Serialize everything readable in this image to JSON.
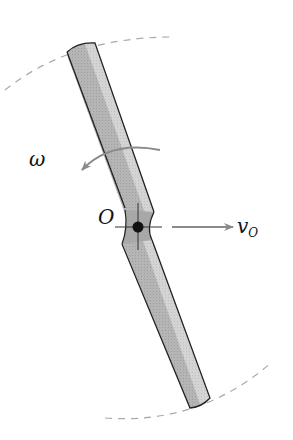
{
  "figure": {
    "labels": {
      "omega": "ω",
      "pivot": "O",
      "velocity_main": "v",
      "velocity_sub": "O"
    },
    "colors": {
      "background": "#ffffff",
      "rod_dark": "#9a9a9a",
      "rod_mid": "#b8b8b8",
      "rod_light": "#d8d8d8",
      "outline": "#222222",
      "arrow": "#8a8a8a",
      "dashed_path": "#aaaaaa",
      "pivot": "#111111"
    }
  }
}
